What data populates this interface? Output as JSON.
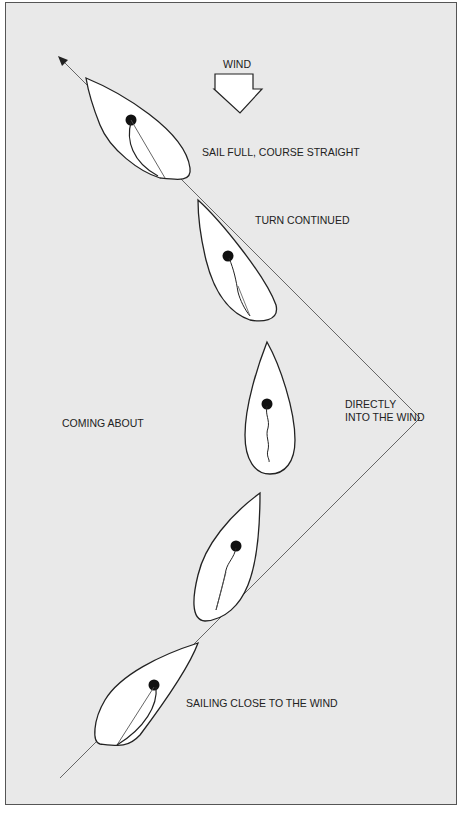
{
  "diagram": {
    "title_label": "WIND",
    "labels": {
      "sail_full": "SAIL FULL, COURSE STRAIGHT",
      "turn_continued": "TURN CONTINUED",
      "coming_about": "COMING ABOUT",
      "directly_line1": "DIRECTLY",
      "directly_line2": "INTO THE WIND",
      "close_to_wind": "SAILING CLOSE TO THE WIND"
    },
    "stages": [
      {
        "order": 1,
        "name": "Sailing close to the wind",
        "sail": "full"
      },
      {
        "order": 2,
        "name": "Coming about (luffing)",
        "sail": "luffing"
      },
      {
        "order": 3,
        "name": "Directly into the wind",
        "sail": "luffing"
      },
      {
        "order": 4,
        "name": "Turn continued",
        "sail": "filling"
      },
      {
        "order": 5,
        "name": "Sail full, course straight",
        "sail": "full"
      }
    ],
    "colors": {
      "background": "#e9e9e9",
      "boat_fill": "#ffffff",
      "outline": "#222222",
      "course_line": "#555555"
    }
  }
}
